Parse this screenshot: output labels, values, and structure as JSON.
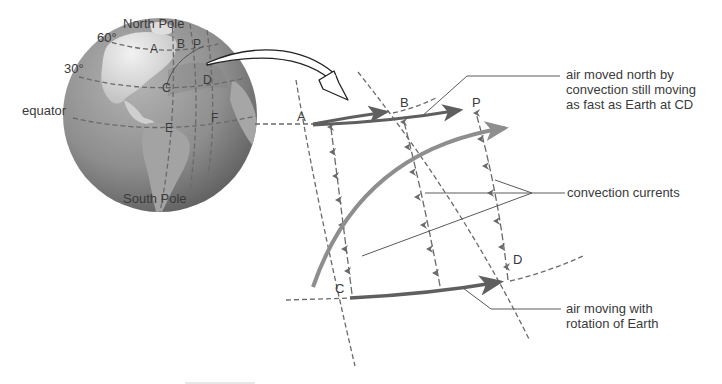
{
  "figure": {
    "globe": {
      "labels": {
        "north_pole": "North Pole",
        "south_pole": "South Pole",
        "lat60": "60°",
        "lat30": "30°",
        "equator": "equator"
      },
      "points": {
        "A": "A",
        "B": "B",
        "P": "P",
        "C": "C",
        "D": "D",
        "E": "E",
        "F": "F"
      }
    },
    "detail": {
      "points": {
        "A": "A",
        "B": "B",
        "P": "P",
        "C": "C",
        "D": "D"
      },
      "callouts": {
        "top": [
          "air moved north by",
          "convection still moving",
          "as fast as Earth at CD"
        ],
        "middle": "convection currents",
        "bottom": [
          "air moving with",
          "rotation of Earth"
        ]
      }
    },
    "colors": {
      "globe_ocean": "#8c8c8c",
      "globe_land": "#d6d6d6",
      "arrow_dark": "#5f5f5f",
      "arrow_light": "#8e8e8e",
      "text": "#3a3a3a"
    }
  }
}
